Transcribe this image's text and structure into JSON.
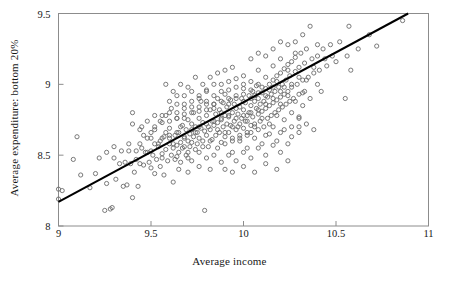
{
  "chart_data": {
    "type": "scatter",
    "title": "",
    "xlabel": "Average income",
    "ylabel": "Average expenditure: bottom 20%",
    "xlim": [
      9,
      11
    ],
    "ylim": [
      8,
      9.5
    ],
    "xticks": [
      "9",
      "9.5",
      "10",
      "10.5",
      "11"
    ],
    "xtick_values": [
      9,
      9.5,
      10,
      10.5,
      11
    ],
    "yticks": [
      "8",
      "8.5",
      "9",
      "9.5"
    ],
    "ytick_values": [
      8,
      8.5,
      9,
      9.5
    ],
    "grid": false,
    "legend": null,
    "marker": "open-circle",
    "marker_color": "#6b6b6b",
    "line_color": "#000000",
    "frame_color": "#8c8c8c",
    "background": "#ffffff",
    "fit_line": {
      "label": "regression line",
      "x": [
        9.0,
        10.89
      ],
      "y": [
        8.17,
        9.5
      ],
      "slope": 0.704,
      "intercept": 1.834
    },
    "n_points": 404,
    "points": [
      [
        9.0,
        8.26
      ],
      [
        9.0,
        8.19
      ],
      [
        9.02,
        8.25
      ],
      [
        9.1,
        8.63
      ],
      [
        9.08,
        8.47
      ],
      [
        9.12,
        8.36
      ],
      [
        9.17,
        8.27
      ],
      [
        9.2,
        8.37
      ],
      [
        9.22,
        8.48
      ],
      [
        9.25,
        8.11
      ],
      [
        9.26,
        8.3
      ],
      [
        9.28,
        8.12
      ],
      [
        9.29,
        8.13
      ],
      [
        9.3,
        8.48
      ],
      [
        9.31,
        8.33
      ],
      [
        9.33,
        8.44
      ],
      [
        9.35,
        8.28
      ],
      [
        9.36,
        8.45
      ],
      [
        9.37,
        8.29
      ],
      [
        9.38,
        8.53
      ],
      [
        9.39,
        8.44
      ],
      [
        9.4,
        8.8
      ],
      [
        9.4,
        8.2
      ],
      [
        9.41,
        8.38
      ],
      [
        9.42,
        8.47
      ],
      [
        9.43,
        8.28
      ],
      [
        9.44,
        8.44
      ],
      [
        9.45,
        8.55
      ],
      [
        9.46,
        8.43
      ],
      [
        9.47,
        8.52
      ],
      [
        9.48,
        8.62
      ],
      [
        9.49,
        8.45
      ],
      [
        9.5,
        8.53
      ],
      [
        9.5,
        8.41
      ],
      [
        9.51,
        8.5
      ],
      [
        9.52,
        8.37
      ],
      [
        9.52,
        8.68
      ],
      [
        9.53,
        8.47
      ],
      [
        9.54,
        8.56
      ],
      [
        9.55,
        8.42
      ],
      [
        9.55,
        8.74
      ],
      [
        9.56,
        8.51
      ],
      [
        9.57,
        8.63
      ],
      [
        9.57,
        8.36
      ],
      [
        9.58,
        8.54
      ],
      [
        9.58,
        8.78
      ],
      [
        9.59,
        8.46
      ],
      [
        9.6,
        8.58
      ],
      [
        9.6,
        8.69
      ],
      [
        9.61,
        8.5
      ],
      [
        9.61,
        8.83
      ],
      [
        9.62,
        8.55
      ],
      [
        9.62,
        8.31
      ],
      [
        9.63,
        8.64
      ],
      [
        9.63,
        8.47
      ],
      [
        9.64,
        8.57
      ],
      [
        9.64,
        8.76
      ],
      [
        9.65,
        8.52
      ],
      [
        9.65,
        8.66
      ],
      [
        9.66,
        8.59
      ],
      [
        9.66,
        8.45
      ],
      [
        9.67,
        8.71
      ],
      [
        9.67,
        8.55
      ],
      [
        9.68,
        8.62
      ],
      [
        9.68,
        8.83
      ],
      [
        9.69,
        8.5
      ],
      [
        9.69,
        8.68
      ],
      [
        9.7,
        8.6
      ],
      [
        9.7,
        8.75
      ],
      [
        9.7,
        8.48
      ],
      [
        9.71,
        8.65
      ],
      [
        9.71,
        8.56
      ],
      [
        9.72,
        8.72
      ],
      [
        9.72,
        8.59
      ],
      [
        9.73,
        8.8
      ],
      [
        9.73,
        8.63
      ],
      [
        9.74,
        8.54
      ],
      [
        9.74,
        8.7
      ],
      [
        9.75,
        8.66
      ],
      [
        9.75,
        8.58
      ],
      [
        9.76,
        8.76
      ],
      [
        9.76,
        8.62
      ],
      [
        9.77,
        8.69
      ],
      [
        9.77,
        8.88
      ],
      [
        9.78,
        8.6
      ],
      [
        9.78,
        8.73
      ],
      [
        9.79,
        8.11
      ],
      [
        9.79,
        8.67
      ],
      [
        9.8,
        8.78
      ],
      [
        9.8,
        8.64
      ],
      [
        9.8,
        8.95
      ],
      [
        9.81,
        8.7
      ],
      [
        9.81,
        8.56
      ],
      [
        9.82,
        8.82
      ],
      [
        9.82,
        8.68
      ],
      [
        9.83,
        8.74
      ],
      [
        9.83,
        8.61
      ],
      [
        9.84,
        8.86
      ],
      [
        9.84,
        8.71
      ],
      [
        9.85,
        8.64
      ],
      [
        9.85,
        8.79
      ],
      [
        9.86,
        8.9
      ],
      [
        9.86,
        8.73
      ],
      [
        9.87,
        8.66
      ],
      [
        9.87,
        8.82
      ],
      [
        9.88,
        8.75
      ],
      [
        9.88,
        8.59
      ],
      [
        9.89,
        8.87
      ],
      [
        9.89,
        8.7
      ],
      [
        9.9,
        8.78
      ],
      [
        9.9,
        8.63
      ],
      [
        9.9,
        8.93
      ],
      [
        9.91,
        8.72
      ],
      [
        9.91,
        8.84
      ],
      [
        9.92,
        8.66
      ],
      [
        9.92,
        8.77
      ],
      [
        9.93,
        8.89
      ],
      [
        9.93,
        8.71
      ],
      [
        9.94,
        8.8
      ],
      [
        9.94,
        8.62
      ],
      [
        9.95,
        8.86
      ],
      [
        9.95,
        8.74
      ],
      [
        9.96,
        8.68
      ],
      [
        9.96,
        8.92
      ],
      [
        9.97,
        8.79
      ],
      [
        9.97,
        8.7
      ],
      [
        9.98,
        8.84
      ],
      [
        9.98,
        8.64
      ],
      [
        9.99,
        8.9
      ],
      [
        9.99,
        8.76
      ],
      [
        10.0,
        8.82
      ],
      [
        10.0,
        8.69
      ],
      [
        10.0,
        8.97
      ],
      [
        10.01,
        8.74
      ],
      [
        10.01,
        8.87
      ],
      [
        10.02,
        8.78
      ],
      [
        10.02,
        8.66
      ],
      [
        10.03,
        8.92
      ],
      [
        10.03,
        8.8
      ],
      [
        10.04,
        8.71
      ],
      [
        10.04,
        8.85
      ],
      [
        10.05,
        8.95
      ],
      [
        10.05,
        8.77
      ],
      [
        10.06,
        8.88
      ],
      [
        10.06,
        8.72
      ],
      [
        10.07,
        8.83
      ],
      [
        10.07,
        8.99
      ],
      [
        10.08,
        8.79
      ],
      [
        10.08,
        8.9
      ],
      [
        10.09,
        8.74
      ],
      [
        10.09,
        8.86
      ],
      [
        10.1,
        8.94
      ],
      [
        10.1,
        8.81
      ],
      [
        10.11,
        8.7
      ],
      [
        10.11,
        8.88
      ],
      [
        10.12,
        8.97
      ],
      [
        10.12,
        8.83
      ],
      [
        10.13,
        8.76
      ],
      [
        10.13,
        8.91
      ],
      [
        10.14,
        9.0
      ],
      [
        10.14,
        8.85
      ],
      [
        10.15,
        8.78
      ],
      [
        10.15,
        8.93
      ],
      [
        10.16,
        9.03
      ],
      [
        10.16,
        8.87
      ],
      [
        10.17,
        8.8
      ],
      [
        10.17,
        8.95
      ],
      [
        10.18,
        9.06
      ],
      [
        10.18,
        8.89
      ],
      [
        10.19,
        8.82
      ],
      [
        10.19,
        8.98
      ],
      [
        10.2,
        9.08
      ],
      [
        10.2,
        8.91
      ],
      [
        10.21,
        8.84
      ],
      [
        10.21,
        9.0
      ],
      [
        10.22,
        9.11
      ],
      [
        10.22,
        8.93
      ],
      [
        10.23,
        8.86
      ],
      [
        10.23,
        9.03
      ],
      [
        10.24,
        9.14
      ],
      [
        10.24,
        8.95
      ],
      [
        10.25,
        8.88
      ],
      [
        10.25,
        9.06
      ],
      [
        10.26,
        9.16
      ],
      [
        10.26,
        8.98
      ],
      [
        10.27,
        8.9
      ],
      [
        10.28,
        9.09
      ],
      [
        10.28,
        9.19
      ],
      [
        10.29,
        9.0
      ],
      [
        10.3,
        8.93
      ],
      [
        10.3,
        9.12
      ],
      [
        10.31,
        9.22
      ],
      [
        10.32,
        9.03
      ],
      [
        10.33,
        8.95
      ],
      [
        10.33,
        9.15
      ],
      [
        10.34,
        9.25
      ],
      [
        10.35,
        9.05
      ],
      [
        10.36,
        9.41
      ],
      [
        10.37,
        9.18
      ],
      [
        10.38,
        9.08
      ],
      [
        10.4,
        9.2
      ],
      [
        10.41,
        9.1
      ],
      [
        10.43,
        9.25
      ],
      [
        10.45,
        9.13
      ],
      [
        10.47,
        9.28
      ],
      [
        10.5,
        9.16
      ],
      [
        10.52,
        9.3
      ],
      [
        10.55,
        8.9
      ],
      [
        10.56,
        9.2
      ],
      [
        10.57,
        9.41
      ],
      [
        10.58,
        9.1
      ],
      [
        10.62,
        9.25
      ],
      [
        10.68,
        9.35
      ],
      [
        10.72,
        9.27
      ],
      [
        10.86,
        9.45
      ],
      [
        9.55,
        8.6
      ],
      [
        9.58,
        8.66
      ],
      [
        9.62,
        8.58
      ],
      [
        9.66,
        8.7
      ],
      [
        9.7,
        8.52
      ],
      [
        9.74,
        8.66
      ],
      [
        9.78,
        8.56
      ],
      [
        9.82,
        8.6
      ],
      [
        9.86,
        8.55
      ],
      [
        9.9,
        8.58
      ],
      [
        9.94,
        8.52
      ],
      [
        9.98,
        8.6
      ],
      [
        10.02,
        8.55
      ],
      [
        10.06,
        8.62
      ],
      [
        10.1,
        8.58
      ],
      [
        10.14,
        8.65
      ],
      [
        10.18,
        8.6
      ],
      [
        10.22,
        8.68
      ],
      [
        10.26,
        8.63
      ],
      [
        10.3,
        8.7
      ],
      [
        9.6,
        8.88
      ],
      [
        9.64,
        8.92
      ],
      [
        9.68,
        8.86
      ],
      [
        9.72,
        8.95
      ],
      [
        9.76,
        8.9
      ],
      [
        9.8,
        8.86
      ],
      [
        9.84,
        9.0
      ],
      [
        9.88,
        8.95
      ],
      [
        9.92,
        9.02
      ],
      [
        9.96,
        8.98
      ],
      [
        10.0,
        9.06
      ],
      [
        10.04,
        9.02
      ],
      [
        10.08,
        9.1
      ],
      [
        10.12,
        9.05
      ],
      [
        10.16,
        9.13
      ],
      [
        10.2,
        9.18
      ],
      [
        10.24,
        9.1
      ],
      [
        10.28,
        9.22
      ],
      [
        9.45,
        8.7
      ],
      [
        9.5,
        8.66
      ],
      [
        9.52,
        8.78
      ],
      [
        9.56,
        8.73
      ],
      [
        9.6,
        8.8
      ],
      [
        9.64,
        8.76
      ],
      [
        9.68,
        8.79
      ],
      [
        9.72,
        8.84
      ],
      [
        9.76,
        8.81
      ],
      [
        9.8,
        8.88
      ],
      [
        9.84,
        8.83
      ],
      [
        9.88,
        8.8
      ],
      [
        9.92,
        8.86
      ],
      [
        9.96,
        8.83
      ],
      [
        10.0,
        8.88
      ],
      [
        10.04,
        8.9
      ],
      [
        10.08,
        8.94
      ],
      [
        10.12,
        8.92
      ],
      [
        10.16,
        8.98
      ],
      [
        10.2,
        8.95
      ],
      [
        9.48,
        8.52
      ],
      [
        9.52,
        8.58
      ],
      [
        9.56,
        8.48
      ],
      [
        9.6,
        8.62
      ],
      [
        9.64,
        8.49
      ],
      [
        9.68,
        8.56
      ],
      [
        9.72,
        8.46
      ],
      [
        9.76,
        8.52
      ],
      [
        9.8,
        8.48
      ],
      [
        9.84,
        8.5
      ],
      [
        9.88,
        8.45
      ],
      [
        9.92,
        8.5
      ],
      [
        9.96,
        8.46
      ],
      [
        10.0,
        8.52
      ],
      [
        10.04,
        8.48
      ],
      [
        10.08,
        8.55
      ],
      [
        10.12,
        8.5
      ],
      [
        10.16,
        8.57
      ],
      [
        10.2,
        8.52
      ],
      [
        10.24,
        8.58
      ],
      [
        9.9,
        8.4
      ],
      [
        9.94,
        8.38
      ],
      [
        10.0,
        8.42
      ],
      [
        10.06,
        8.38
      ],
      [
        10.12,
        8.44
      ],
      [
        10.18,
        8.4
      ],
      [
        10.24,
        8.46
      ],
      [
        9.76,
        8.42
      ],
      [
        9.82,
        8.4
      ],
      [
        9.7,
        8.38
      ],
      [
        9.65,
        8.4
      ],
      [
        10.3,
        8.77
      ],
      [
        10.32,
        8.85
      ],
      [
        10.34,
        9.03
      ],
      [
        10.36,
        8.9
      ],
      [
        10.38,
        9.12
      ],
      [
        10.4,
        9.0
      ],
      [
        10.42,
        8.95
      ],
      [
        9.9,
        9.1
      ],
      [
        9.94,
        9.12
      ],
      [
        9.86,
        9.08
      ],
      [
        9.82,
        9.05
      ],
      [
        9.78,
        9.0
      ],
      [
        9.74,
        9.05
      ],
      [
        9.7,
        8.98
      ],
      [
        9.66,
        9.0
      ],
      [
        9.62,
        8.95
      ],
      [
        9.58,
        9.0
      ],
      [
        10.04,
        9.18
      ],
      [
        10.08,
        9.22
      ],
      [
        10.12,
        9.2
      ],
      [
        10.16,
        9.25
      ],
      [
        10.2,
        9.3
      ],
      [
        10.24,
        9.28
      ],
      [
        10.28,
        9.3
      ],
      [
        10.32,
        9.35
      ],
      [
        9.86,
        8.68
      ],
      [
        9.9,
        8.66
      ],
      [
        9.94,
        8.7
      ],
      [
        9.98,
        8.72
      ],
      [
        10.02,
        8.74
      ],
      [
        10.06,
        8.7
      ],
      [
        10.1,
        8.76
      ],
      [
        10.14,
        8.72
      ],
      [
        10.18,
        8.78
      ],
      [
        10.22,
        8.75
      ],
      [
        10.26,
        8.8
      ],
      [
        10.3,
        8.76
      ],
      [
        9.92,
        8.78
      ],
      [
        9.96,
        8.76
      ],
      [
        10.0,
        8.78
      ],
      [
        10.04,
        8.8
      ],
      [
        10.08,
        8.82
      ],
      [
        9.72,
        8.68
      ],
      [
        9.76,
        8.7
      ],
      [
        9.8,
        8.72
      ],
      [
        9.84,
        8.74
      ],
      [
        9.88,
        8.76
      ],
      [
        9.56,
        8.62
      ],
      [
        9.6,
        8.64
      ],
      [
        9.64,
        8.66
      ],
      [
        9.68,
        8.63
      ],
      [
        9.5,
        8.62
      ],
      [
        9.54,
        8.58
      ],
      [
        10.04,
        8.66
      ],
      [
        10.08,
        8.68
      ],
      [
        10.12,
        8.64
      ],
      [
        10.16,
        8.7
      ],
      [
        10.2,
        8.66
      ],
      [
        9.98,
        8.62
      ],
      [
        10.02,
        8.64
      ],
      [
        9.94,
        8.6
      ],
      [
        10.26,
        8.7
      ],
      [
        10.3,
        8.66
      ],
      [
        10.34,
        8.72
      ],
      [
        10.38,
        8.68
      ],
      [
        9.44,
        8.58
      ],
      [
        9.46,
        8.64
      ],
      [
        9.42,
        8.53
      ],
      [
        9.38,
        8.58
      ],
      [
        9.34,
        8.53
      ],
      [
        9.3,
        8.56
      ],
      [
        9.26,
        8.52
      ],
      [
        9.52,
        8.7
      ],
      [
        9.48,
        8.74
      ],
      [
        9.44,
        8.68
      ],
      [
        9.4,
        8.72
      ],
      [
        10.0,
        9.0
      ],
      [
        10.04,
        8.96
      ],
      [
        10.08,
        9.0
      ],
      [
        9.96,
        9.04
      ],
      [
        9.92,
        8.96
      ],
      [
        9.88,
        9.0
      ],
      [
        9.84,
        8.92
      ],
      [
        9.8,
        8.96
      ],
      [
        9.76,
        8.92
      ],
      [
        9.72,
        8.88
      ],
      [
        9.68,
        8.92
      ],
      [
        9.64,
        8.86
      ],
      [
        10.12,
        8.86
      ],
      [
        10.16,
        8.9
      ],
      [
        10.2,
        8.86
      ],
      [
        10.24,
        8.92
      ],
      [
        10.28,
        8.88
      ],
      [
        10.32,
        8.94
      ],
      [
        10.4,
        9.28
      ],
      [
        10.44,
        9.18
      ],
      [
        10.48,
        9.2
      ],
      [
        9.96,
        8.9
      ],
      [
        10.0,
        8.93
      ],
      [
        9.92,
        8.9
      ],
      [
        9.88,
        8.88
      ],
      [
        9.84,
        8.86
      ],
      [
        9.8,
        8.82
      ],
      [
        9.76,
        8.84
      ],
      [
        9.72,
        8.8
      ],
      [
        9.68,
        8.76
      ],
      [
        9.64,
        8.8
      ],
      [
        9.6,
        8.74
      ],
      [
        9.56,
        8.78
      ],
      [
        10.26,
        9.0
      ],
      [
        10.3,
        9.05
      ],
      [
        10.22,
        8.98
      ],
      [
        10.18,
        9.02
      ],
      [
        10.14,
        8.96
      ],
      [
        10.1,
        8.98
      ],
      [
        10.06,
        8.92
      ]
    ]
  }
}
